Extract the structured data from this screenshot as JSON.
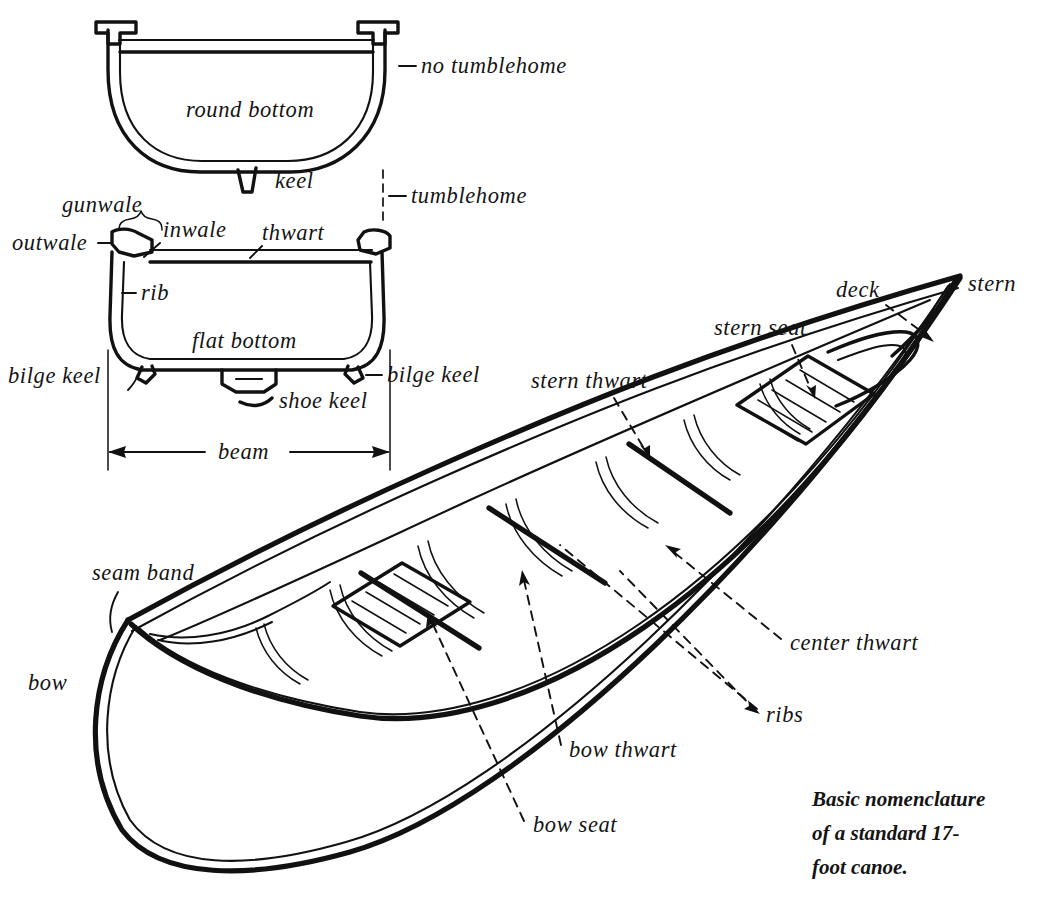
{
  "figure": {
    "caption_lines": [
      "Basic nomenclature",
      "of a standard 17-",
      "foot canoe."
    ],
    "background_color": "#ffffff",
    "ink_color": "#111111"
  },
  "cross_section_round": {
    "name": "round bottom hull cross-section",
    "interior_label": "round bottom",
    "labels": {
      "no_tumblehome": "no tumblehome",
      "keel": "keel"
    }
  },
  "cross_section_flat": {
    "name": "flat bottom hull cross-section",
    "interior_label": "flat bottom",
    "labels": {
      "tumblehome": "tumblehome",
      "gunwale": "gunwale",
      "outwale": "outwale",
      "inwale": "inwale",
      "thwart": "thwart",
      "rib": "rib",
      "bilge_keel_left": "bilge keel",
      "bilge_keel_right": "bilge keel",
      "shoe_keel": "shoe keel",
      "beam": "beam"
    }
  },
  "canoe_perspective": {
    "name": "three-quarter perspective view of canoe",
    "labels": {
      "stern": "stern",
      "deck": "deck",
      "stern_seat": "stern seat",
      "stern_thwart": "stern thwart",
      "center_thwart": "center thwart",
      "ribs": "ribs",
      "bow_thwart": "bow thwart",
      "bow_seat": "bow seat",
      "seam_band": "seam band",
      "bow": "bow"
    }
  }
}
